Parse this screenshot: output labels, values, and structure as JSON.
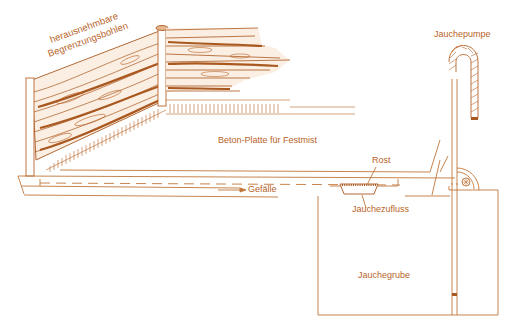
{
  "colors": {
    "ink": "#c0763a",
    "ink_dark": "#a9581f",
    "label": "#b8642a",
    "background": "#ffffff"
  },
  "labels": {
    "boards_line1": "herausnehmbare",
    "boards_line2": "Begrenzungsbohlen",
    "slab": "Beton-Platte für Festmist",
    "pump": "Jauchepumpe",
    "grate": "Rost",
    "slope": "Gefälle",
    "inflow": "Jauchezufluss",
    "pit": "Jauchegrube"
  }
}
